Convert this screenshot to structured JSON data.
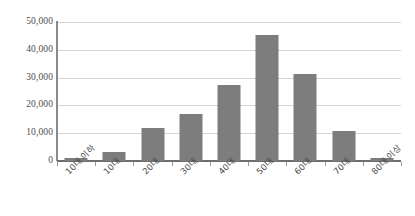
{
  "chart_data": {
    "type": "bar",
    "title": "",
    "xlabel": "",
    "ylabel": "",
    "categories": [
      "10대 이하",
      "10대",
      "20대",
      "30대",
      "40대",
      "50대",
      "60대",
      "70대",
      "80대 이상"
    ],
    "values": [
      1000,
      3300,
      11800,
      16900,
      27300,
      45200,
      31300,
      10900,
      1200
    ],
    "ylim": [
      0,
      50000
    ],
    "yticks": [
      0,
      10000,
      20000,
      30000,
      40000,
      50000
    ],
    "ytick_labels": [
      "0",
      "10,000",
      "20,000",
      "30,000",
      "40,000",
      "50,000"
    ],
    "grid": true,
    "legend": false,
    "series": [
      {
        "name": "",
        "values": [
          1000,
          3300,
          11800,
          16900,
          27300,
          45200,
          31300,
          10900,
          1200
        ]
      }
    ]
  },
  "style": {
    "bar_color": "#7d7d7d",
    "gridline_color": "#d4d4d4",
    "axis_color": "#6e6e6e",
    "tick_label_color": "#4d4d4d",
    "background": "#ffffff"
  }
}
